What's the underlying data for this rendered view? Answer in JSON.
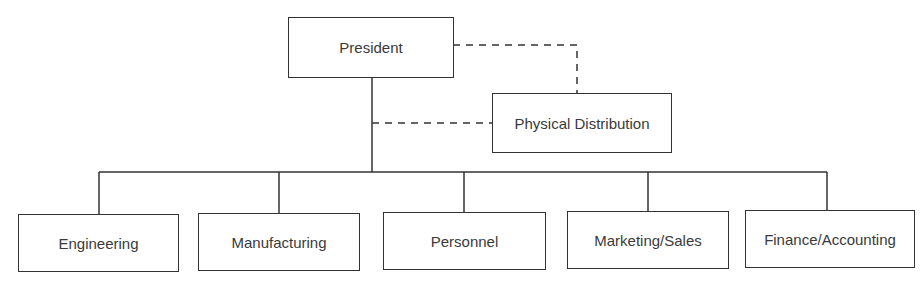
{
  "diagram": {
    "type": "organization-chart",
    "root": {
      "id": "president",
      "label": "President"
    },
    "staff": {
      "id": "physical-distribution",
      "label": "Physical Distribution",
      "relation": "dashed-advisory"
    },
    "departments": [
      {
        "id": "engineering",
        "label": "Engineering"
      },
      {
        "id": "manufacturing",
        "label": "Manufacturing"
      },
      {
        "id": "personnel",
        "label": "Personnel"
      },
      {
        "id": "marketing-sales",
        "label": "Marketing/Sales"
      },
      {
        "id": "finance-accounting",
        "label": "Finance/Accounting"
      }
    ],
    "line_color": "#333333"
  }
}
